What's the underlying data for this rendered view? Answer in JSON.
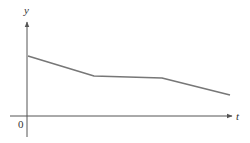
{
  "chart_data": {
    "type": "line",
    "title": "",
    "xlabel": "t",
    "ylabel": "y",
    "origin_label": "0",
    "grid": false,
    "legend": null,
    "x": [
      0,
      66,
      134,
      202
    ],
    "series": [
      {
        "name": "y(t)",
        "values": [
          60,
          40,
          38,
          21
        ]
      }
    ],
    "xlim": [
      -17,
      210
    ],
    "ylim": [
      -21,
      94
    ]
  },
  "colors": {
    "axis": "#555555",
    "line": "#777777",
    "text": "#333333"
  }
}
